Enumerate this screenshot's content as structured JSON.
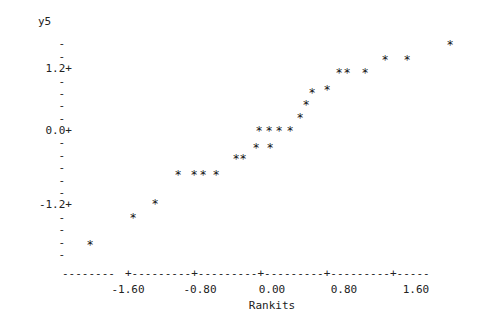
{
  "chart_data": {
    "type": "scatter",
    "title": "",
    "subtitle": "",
    "xlabel": "Rankits",
    "ylabel": "y5",
    "marker": "*",
    "grid": false,
    "legend": null,
    "xlim": [
      -2.05,
      2.05
    ],
    "ylim": [
      -1.95,
      1.75
    ],
    "xticks": [
      "-1.60",
      "-0.80",
      "0.00",
      "0.80",
      "1.60"
    ],
    "xtick_values": [
      -1.6,
      -0.8,
      0.0,
      0.8,
      1.6
    ],
    "yticks": [
      "1.2+",
      "0.0+",
      "-1.2+"
    ],
    "ytick_values": [
      1.2,
      0.0,
      -1.2
    ],
    "y_minor_tick_count": 4,
    "n_points": 30,
    "x": [
      -1.97,
      -1.37,
      -1.07,
      -0.85,
      -0.67,
      -0.62,
      -0.48,
      -0.33,
      -0.25,
      -0.15,
      -0.07,
      0.02,
      0.1,
      0.18,
      0.26,
      0.34,
      0.45,
      0.56,
      0.67,
      0.79,
      0.93,
      1.0,
      1.2,
      1.35,
      1.5,
      1.72,
      1.97,
      0.38,
      0.6,
      1.1
    ],
    "y": [
      -1.72,
      -1.38,
      -1.17,
      -0.72,
      -0.72,
      -0.72,
      -0.72,
      -0.45,
      -0.45,
      -0.27,
      -0.27,
      -0.03,
      -0.03,
      -0.03,
      -0.03,
      0.17,
      0.33,
      0.52,
      0.62,
      0.62,
      0.82,
      0.82,
      0.82,
      1.05,
      1.05,
      1.27,
      1.27,
      -0.03,
      0.33,
      0.82
    ],
    "points_px": [
      {
        "px": 90,
        "py": 245
      },
      {
        "px": 133,
        "py": 218
      },
      {
        "px": 155,
        "py": 204
      },
      {
        "px": 178,
        "py": 175
      },
      {
        "px": 194,
        "py": 175
      },
      {
        "px": 203,
        "py": 175
      },
      {
        "px": 216,
        "py": 175
      },
      {
        "px": 236,
        "py": 159
      },
      {
        "px": 243,
        "py": 159
      },
      {
        "px": 256,
        "py": 148
      },
      {
        "px": 270,
        "py": 148
      },
      {
        "px": 259,
        "py": 131
      },
      {
        "px": 269,
        "py": 131
      },
      {
        "px": 279,
        "py": 131
      },
      {
        "px": 290,
        "py": 131
      },
      {
        "px": 300,
        "py": 118
      },
      {
        "px": 306,
        "py": 105
      },
      {
        "px": 312,
        "py": 93
      },
      {
        "px": 327,
        "py": 90
      },
      {
        "px": 339,
        "py": 73
      },
      {
        "px": 347,
        "py": 73
      },
      {
        "px": 365,
        "py": 73
      },
      {
        "px": 385,
        "py": 60
      },
      {
        "px": 407,
        "py": 60
      },
      {
        "px": 450,
        "py": 45
      }
    ],
    "annotations": []
  },
  "axes": {
    "y_axis_title": "y5",
    "y_tick_labels": [
      {
        "text": "1.2+",
        "top": 63
      },
      {
        "text": "0.0+",
        "top": 125
      },
      {
        "text": "-1.2+",
        "top": 199
      }
    ],
    "y_minor_dashes": [
      {
        "text": "-",
        "top": 38
      },
      {
        "text": "-",
        "top": 51
      },
      {
        "text": "-",
        "top": 76
      },
      {
        "text": "-",
        "top": 88
      },
      {
        "text": "-",
        "top": 100
      },
      {
        "text": "-",
        "top": 113
      },
      {
        "text": "-",
        "top": 137
      },
      {
        "text": "-",
        "top": 150
      },
      {
        "text": "-",
        "top": 162
      },
      {
        "text": "-",
        "top": 175
      },
      {
        "text": "-",
        "top": 187
      },
      {
        "text": "-",
        "top": 212
      },
      {
        "text": "-",
        "top": 224
      },
      {
        "text": "-",
        "top": 237
      },
      {
        "text": "-",
        "top": 249
      }
    ],
    "x_axis_line": "+---------+---------+---------+---------+-----",
    "x_axis_lead": "--------",
    "x_tick_labels": [
      {
        "text": "-1.60",
        "left": 128
      },
      {
        "text": "-0.80",
        "left": 200
      },
      {
        "text": "0.00",
        "left": 272
      },
      {
        "text": "0.80",
        "left": 344
      },
      {
        "text": "1.60",
        "left": 416
      }
    ],
    "x_axis_title": "Rankits"
  },
  "style": {
    "background": "#ffffff",
    "ink": "#222222",
    "marker_color": "#111111"
  }
}
